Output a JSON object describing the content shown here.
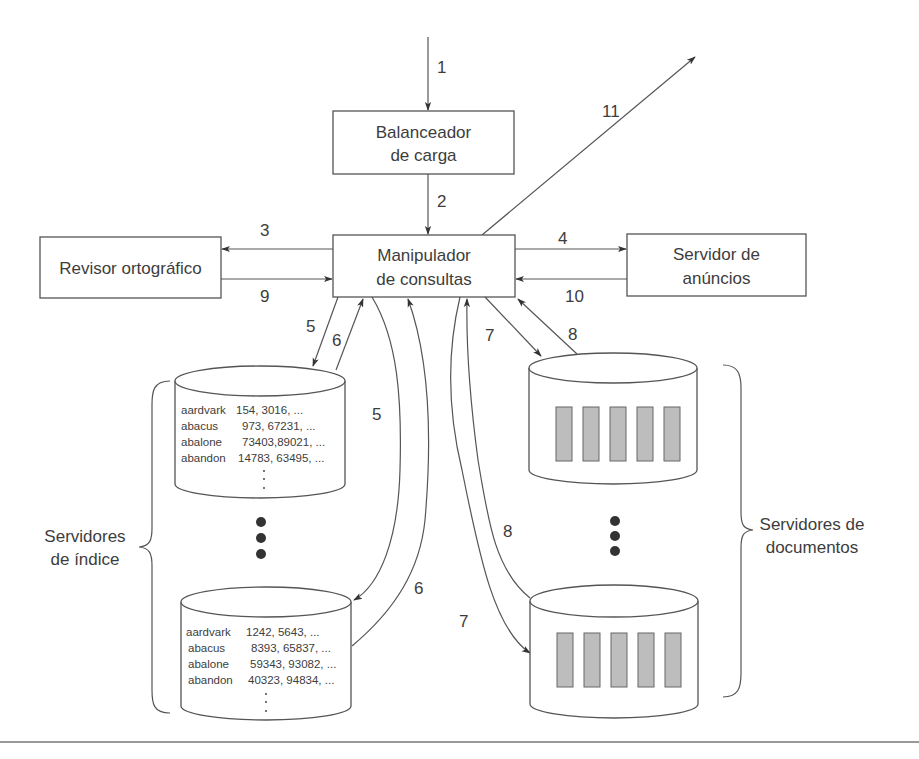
{
  "diagram": {
    "components": {
      "load_balancer": [
        "Balanceador",
        "de carga"
      ],
      "query_handler": [
        "Manipulador",
        "de consultas"
      ],
      "spell_checker": [
        "Revisor ortográfico"
      ],
      "ad_server": [
        "Servidor de",
        "anúncios"
      ],
      "index_servers_label": [
        "Servidores",
        "de índice"
      ],
      "document_servers_label": [
        "Servidores de",
        "documentos"
      ]
    },
    "index_server_1": {
      "rows": [
        {
          "term": "aardvark",
          "postings": "154, 3016, ..."
        },
        {
          "term": "abacus",
          "postings": "973, 67231, ..."
        },
        {
          "term": "abalone",
          "postings": "73403,89021, ..."
        },
        {
          "term": "abandon",
          "postings": "14783, 63495, ..."
        }
      ]
    },
    "index_server_2": {
      "rows": [
        {
          "term": "aardvark",
          "postings": "1242, 5643, ..."
        },
        {
          "term": "abacus",
          "postings": "8393, 65837, ..."
        },
        {
          "term": "abalone",
          "postings": "59343, 93082, ..."
        },
        {
          "term": "abandon",
          "postings": "40323, 94834, ..."
        }
      ]
    },
    "steps": {
      "s1": "1",
      "s2": "2",
      "s3": "3",
      "s4": "4",
      "s5a": "5",
      "s6a": "6",
      "s5b": "5",
      "s6b": "6",
      "s7a": "7",
      "s8a": "8",
      "s7b": "7",
      "s8b": "8",
      "s9": "9",
      "s10": "10",
      "s11": "11"
    }
  }
}
